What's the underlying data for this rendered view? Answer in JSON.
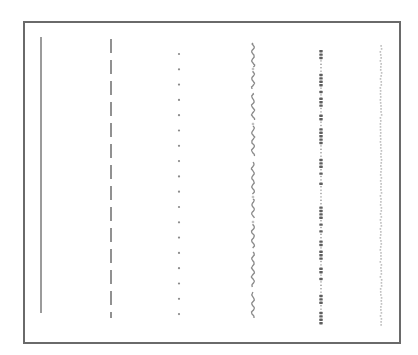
{
  "diagram": {
    "title": "",
    "background": "#ffffff",
    "frame": {
      "x": 24,
      "y": 22,
      "width": 376,
      "height": 321,
      "stroke": "#6a6a6a",
      "stroke_width": 2
    },
    "line_samples": [
      {
        "id": "solid",
        "style": "solid",
        "x": 41,
        "y1": 37,
        "y2": 313,
        "color": "#7a7a7a",
        "width": 1.5
      },
      {
        "id": "dashed",
        "style": "dashed",
        "x": 111,
        "y1": 39,
        "y2": 318,
        "color": "#6e6e6e",
        "width": 1.5,
        "dash": 14,
        "gap": 7
      },
      {
        "id": "dotted",
        "style": "dotted",
        "x": 179,
        "y1": 54,
        "y2": 315,
        "color": "#8a8a8a",
        "dot_radius": 1.1,
        "spacing": 15.3
      },
      {
        "id": "wavy",
        "style": "wavy",
        "x": 253,
        "y1": 43,
        "y2": 318,
        "color": "#8a8a8a",
        "width": 1.3,
        "amplitude": 1.6,
        "wavelength": 9
      },
      {
        "id": "beaded",
        "style": "beaded",
        "x": 321,
        "y1": 50,
        "y2": 322,
        "color": "#5e5e5e",
        "bead_spacing": 3.4
      },
      {
        "id": "faint",
        "style": "faint-dotted",
        "x": 381,
        "y1": 45,
        "y2": 326,
        "color": "#c2c2c2",
        "spacing": 3
      }
    ]
  }
}
